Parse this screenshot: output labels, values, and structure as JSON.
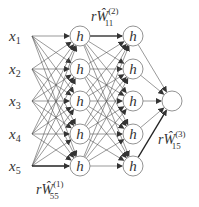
{
  "diagram": {
    "inputs": [
      {
        "name": "x",
        "sub": "1"
      },
      {
        "name": "x",
        "sub": "2"
      },
      {
        "name": "x",
        "sub": "3"
      },
      {
        "name": "x",
        "sub": "4"
      },
      {
        "name": "x",
        "sub": "5"
      }
    ],
    "hidden_node_label": "h",
    "weight_labels": {
      "w1": {
        "prefix": "r",
        "symbol": "Ŵ",
        "sup": "(1)",
        "sub": "55"
      },
      "w2": {
        "prefix": "r",
        "symbol": "Ŵ",
        "sup": "(2)",
        "sub": "11"
      },
      "w3": {
        "prefix": "r",
        "symbol": "Ŵ",
        "sup": "(3)",
        "sub": "15"
      }
    },
    "colors": {
      "line": "#444444",
      "node_stroke": "#666666",
      "text": "#333333"
    }
  }
}
